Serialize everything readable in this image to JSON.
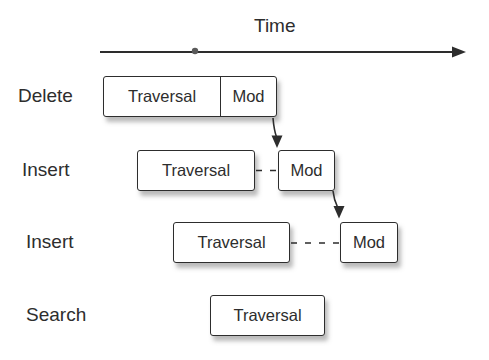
{
  "axis": {
    "label": "Time"
  },
  "rows": [
    {
      "label": "Delete",
      "boxes": [
        "Traversal",
        "Mod"
      ]
    },
    {
      "label": "Insert",
      "boxes": [
        "Traversal",
        "Mod"
      ]
    },
    {
      "label": "Insert",
      "boxes": [
        "Traversal",
        "Mod"
      ]
    },
    {
      "label": "Search",
      "boxes": [
        "Traversal"
      ]
    }
  ],
  "colors": {
    "ink": "#2d2d2d",
    "box-fill": "#ffffff",
    "shadow": "rgba(120,120,120,0.5)",
    "dot": "#5a5a5a",
    "background": "#ffffff"
  }
}
